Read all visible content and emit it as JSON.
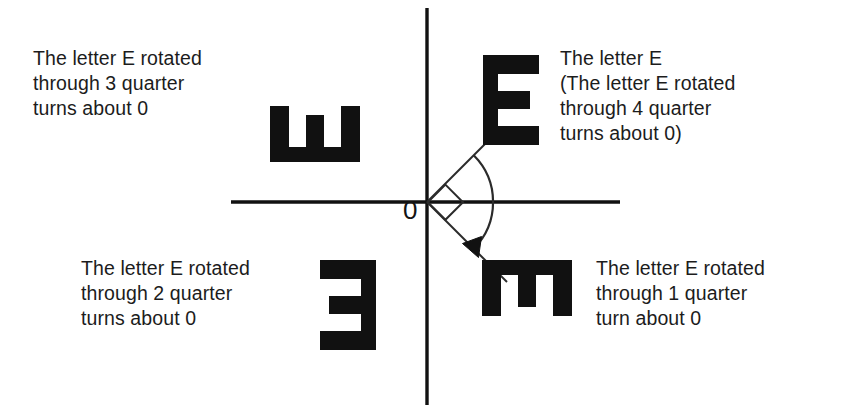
{
  "figure": {
    "background_color": "#ffffff",
    "ink_color": "#111111",
    "origin_label": "0"
  },
  "axes": {
    "origin": {
      "x": 427,
      "y": 202
    },
    "horizontal": {
      "x1": 231,
      "y1": 202,
      "x2": 620,
      "y2": 202
    },
    "vertical": {
      "x1": 427,
      "y1": 8,
      "x2": 427,
      "y2": 405
    },
    "line_width": 3
  },
  "rays": [
    {
      "name": "ray-upper-right",
      "angle_degrees": 45,
      "from": {
        "x": 427,
        "y": 202
      },
      "to": {
        "x": 497,
        "y": 132
      }
    },
    {
      "name": "ray-lower-right",
      "angle_degrees": -45,
      "from": {
        "x": 427,
        "y": 202
      },
      "to": {
        "x": 505,
        "y": 280
      }
    }
  ],
  "right_angle_marker": {
    "name": "right-angle-square",
    "description": "square marker indicating a quarter turn between the two rays",
    "size": 26
  },
  "rotation_arrow": {
    "name": "rotation-arrow",
    "direction": "clockwise",
    "sweep_degrees": 90,
    "start_angle_degrees": 45,
    "end_angle_degrees": -45,
    "radius": 66
  },
  "letters": [
    {
      "id": "e-q1",
      "glyph": "E",
      "quadrant": "top-right",
      "rotation_degrees": 0,
      "quarter_turns": 4,
      "x": 483,
      "y": 55,
      "width": 56,
      "height": 90
    },
    {
      "id": "e-q2",
      "glyph": "E",
      "quadrant": "top-left",
      "rotation_degrees": -90,
      "quarter_turns": 3,
      "x": 287,
      "y": 89,
      "width": 56,
      "height": 90
    },
    {
      "id": "e-q3",
      "glyph": "E",
      "quadrant": "bottom-left",
      "rotation_degrees": 180,
      "quarter_turns": 2,
      "x": 320,
      "y": 260,
      "width": 56,
      "height": 90
    },
    {
      "id": "e-q4",
      "glyph": "E",
      "quadrant": "bottom-right",
      "rotation_degrees": 90,
      "quarter_turns": 1,
      "x": 499,
      "y": 243,
      "width": 56,
      "height": 90
    }
  ],
  "captions": {
    "top_left": "The letter E rotated\nthrough 3 quarter\nturns about 0",
    "top_right": "The letter E\n(The letter E rotated\nthrough 4 quarter\nturns about 0)",
    "bottom_left": "The letter E rotated\nthrough 2 quarter\nturns about 0",
    "bottom_right": "The letter E rotated\nthrough 1 quarter\nturn about 0"
  }
}
